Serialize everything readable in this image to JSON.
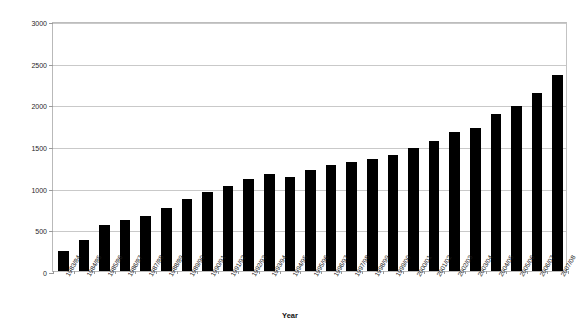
{
  "chart_data": {
    "type": "bar",
    "title": "",
    "xlabel": "Year",
    "ylabel": "Membership totals",
    "ylim": [
      0,
      3000
    ],
    "yticks": [
      0,
      500,
      1000,
      1500,
      2000,
      2500,
      3000
    ],
    "ytick_labels": [
      "0",
      "500",
      "1000",
      "1500",
      "2000",
      "2500",
      "3000"
    ],
    "grid": true,
    "legend": false,
    "bar_color": "#000000",
    "gridline_color": "#c9c9c9",
    "axis_color": "#b9b9b9",
    "categories": [
      "1983/84",
      "1984/85",
      "1985/86",
      "1986/87",
      "1987/88",
      "1988/89",
      "1989/90",
      "1990/91",
      "1991/92",
      "1992/93",
      "1993/94",
      "1994/95",
      "1995/96",
      "1996/97",
      "1997/98",
      "1998/99",
      "1999/00",
      "2000/01",
      "2001/02",
      "2002/03",
      "2003/04",
      "2004/05",
      "2005/06",
      "2006/07",
      "2007/08"
    ],
    "values": [
      240,
      370,
      550,
      610,
      665,
      755,
      865,
      950,
      1025,
      1105,
      1160,
      1130,
      1215,
      1275,
      1305,
      1340,
      1390,
      1480,
      1560,
      1665,
      1720,
      1890,
      1975,
      2140,
      2355
    ]
  },
  "axis": {
    "y_title": "Membership totals",
    "x_title": "Year"
  }
}
